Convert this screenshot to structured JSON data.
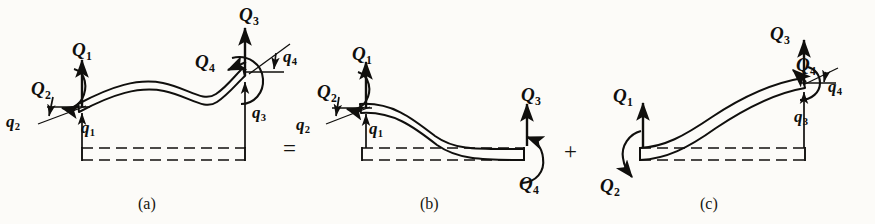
{
  "figure": {
    "background_color": "#fcfbf8",
    "ink_color": "#100f0d",
    "operators": [
      {
        "id": "equals",
        "symbol": "=",
        "x": 283,
        "y": 137
      },
      {
        "id": "plus",
        "symbol": "+",
        "x": 564,
        "y": 140
      }
    ],
    "panels": [
      {
        "id": "panel-a",
        "caption": "(a)",
        "caption_x": 138,
        "caption_y": 196,
        "labels": [
          {
            "id": "a-Q1",
            "text": "Q",
            "sub": "1",
            "kind": "Q",
            "x": 72,
            "y": 40
          },
          {
            "id": "a-Q2",
            "text": "Q",
            "sub": "2",
            "kind": "Q",
            "x": 31,
            "y": 79
          },
          {
            "id": "a-Q3",
            "text": "Q",
            "sub": "3",
            "kind": "Q",
            "x": 239,
            "y": 5
          },
          {
            "id": "a-Q4",
            "text": "Q",
            "sub": "4",
            "kind": "Q",
            "x": 195,
            "y": 52
          },
          {
            "id": "a-q1",
            "text": "q",
            "sub": "1",
            "kind": "q",
            "x": 81,
            "y": 119
          },
          {
            "id": "a-q2",
            "text": "q",
            "sub": "2",
            "kind": "q",
            "x": 6,
            "y": 113
          },
          {
            "id": "a-q3",
            "text": "q",
            "sub": "3",
            "kind": "q",
            "x": 252,
            "y": 104
          },
          {
            "id": "a-q4",
            "text": "q",
            "sub": "4",
            "kind": "q",
            "x": 283,
            "y": 48
          }
        ]
      },
      {
        "id": "panel-b",
        "caption": "(b)",
        "caption_x": 420,
        "caption_y": 196,
        "labels": [
          {
            "id": "b-Q1",
            "text": "Q",
            "sub": "1",
            "kind": "Q",
            "x": 352,
            "y": 44
          },
          {
            "id": "b-Q2",
            "text": "Q",
            "sub": "2",
            "kind": "Q",
            "x": 317,
            "y": 82
          },
          {
            "id": "b-Q3",
            "text": "Q",
            "sub": "3",
            "kind": "Q",
            "x": 521,
            "y": 85
          },
          {
            "id": "b-Q4",
            "text": "Q",
            "sub": "4",
            "kind": "Q",
            "x": 519,
            "y": 174
          },
          {
            "id": "b-q1",
            "text": "q",
            "sub": "1",
            "kind": "q",
            "x": 369,
            "y": 120
          },
          {
            "id": "b-q2",
            "text": "q",
            "sub": "2",
            "kind": "q",
            "x": 296,
            "y": 116
          }
        ]
      },
      {
        "id": "panel-c",
        "caption": "(c)",
        "caption_x": 700,
        "caption_y": 196,
        "labels": [
          {
            "id": "c-Q1",
            "text": "Q",
            "sub": "1",
            "kind": "Q",
            "x": 613,
            "y": 86
          },
          {
            "id": "c-Q2",
            "text": "Q",
            "sub": "2",
            "kind": "Q",
            "x": 600,
            "y": 176
          },
          {
            "id": "c-Q3",
            "text": "Q",
            "sub": "3",
            "kind": "Q",
            "x": 770,
            "y": 24
          },
          {
            "id": "c-Q4",
            "text": "Q",
            "sub": "4",
            "kind": "Q",
            "x": 796,
            "y": 55
          },
          {
            "id": "c-q3",
            "text": "q",
            "sub": "3",
            "kind": "q",
            "x": 794,
            "y": 108
          },
          {
            "id": "c-q4",
            "text": "q",
            "sub": "4",
            "kind": "q",
            "x": 828,
            "y": 78
          }
        ]
      }
    ]
  }
}
